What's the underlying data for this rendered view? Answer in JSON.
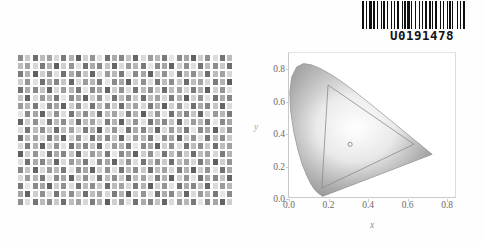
{
  "document": {
    "kind": "scanned-color-test-page",
    "background_color": "#fefefe"
  },
  "barcode": {
    "name": "archive-barcode",
    "value": "U0191478",
    "bar_color": "#101010",
    "pattern": [
      3,
      1,
      1,
      2,
      3,
      1,
      2,
      1,
      1,
      3,
      1,
      1,
      2,
      2,
      1,
      3,
      1,
      2,
      1,
      1,
      3,
      2,
      1,
      1,
      2,
      1,
      3,
      1,
      1,
      2,
      2,
      3,
      1,
      1,
      1,
      2,
      3,
      1,
      2,
      1,
      1,
      1,
      3,
      2,
      1,
      2,
      1,
      3,
      1,
      1,
      2,
      1,
      1,
      3,
      2,
      1,
      1,
      2,
      3,
      1
    ]
  },
  "swatch_chart": {
    "name": "color-swatch-test-chart",
    "columns": 30,
    "rows": 19,
    "cell_w": 7.2,
    "cell_h": 8.0,
    "swatch_w": 5.0,
    "swatch_h": 5.6,
    "note": "grayscale/desaturated scanned patch array",
    "grays": [
      "#8d8d8d",
      "#c9c9c9",
      "#6e6e6e",
      "#bdbdbd",
      "#a2a2a2",
      "#d6d6d6",
      "#7b7b7b",
      "#b2b2b2",
      "#5f5f5f",
      "#cfcfcf",
      "#949494",
      "#e0e0e0",
      "#717171",
      "#aaaaaa",
      "#868686",
      "#c4c4c4",
      "#666666",
      "#d9d9d9",
      "#9b9b9b",
      "#b7b7b7",
      "#7a7a7a",
      "#e4e4e4",
      "#8a8a8a",
      "#a6a6a6",
      "#626262",
      "#cdcdcd",
      "#909090",
      "#dcdcdc",
      "#757575",
      "#bbbbbb"
    ],
    "row_shift": [
      0,
      3,
      6,
      9,
      12,
      15,
      18,
      21,
      24,
      27,
      2,
      5,
      8,
      11,
      14,
      17,
      20,
      23,
      26
    ]
  },
  "chromaticity": {
    "name": "cie-1931-chromaticity-diagram",
    "type": "scatter",
    "xlabel": "x",
    "ylabel": "y",
    "xlim": [
      0.0,
      0.85
    ],
    "ylim": [
      0.0,
      0.9
    ],
    "xticks": [
      "0.0",
      "0.2",
      "0.4",
      "0.6",
      "0.8"
    ],
    "xtick_values": [
      0.0,
      0.2,
      0.4,
      0.6,
      0.8
    ],
    "yticks": [
      "0.0",
      "0.2",
      "0.4",
      "0.6",
      "0.8"
    ],
    "ytick_values": [
      0.0,
      0.2,
      0.4,
      0.6,
      0.8
    ],
    "grid": false,
    "locus_color": "#9a9a9a",
    "gamut_color": "#8a8a8a",
    "whitepoint": {
      "x": 0.313,
      "y": 0.329,
      "label": ""
    },
    "gamut_triangle": [
      {
        "x": 0.64,
        "y": 0.33
      },
      {
        "x": 0.2,
        "y": 0.7
      },
      {
        "x": 0.168,
        "y": 0.055
      }
    ],
    "spectral_locus": [
      {
        "x": 0.1741,
        "y": 0.005
      },
      {
        "x": 0.174,
        "y": 0.005
      },
      {
        "x": 0.1738,
        "y": 0.0049
      },
      {
        "x": 0.1736,
        "y": 0.0049
      },
      {
        "x": 0.1733,
        "y": 0.0048
      },
      {
        "x": 0.173,
        "y": 0.0048
      },
      {
        "x": 0.1726,
        "y": 0.0048
      },
      {
        "x": 0.1721,
        "y": 0.0048
      },
      {
        "x": 0.1714,
        "y": 0.0051
      },
      {
        "x": 0.1703,
        "y": 0.0058
      },
      {
        "x": 0.1689,
        "y": 0.0069
      },
      {
        "x": 0.1669,
        "y": 0.0086
      },
      {
        "x": 0.1644,
        "y": 0.0109
      },
      {
        "x": 0.1611,
        "y": 0.0138
      },
      {
        "x": 0.1566,
        "y": 0.0177
      },
      {
        "x": 0.151,
        "y": 0.0227
      },
      {
        "x": 0.144,
        "y": 0.0297
      },
      {
        "x": 0.1355,
        "y": 0.0399
      },
      {
        "x": 0.1241,
        "y": 0.0578
      },
      {
        "x": 0.1096,
        "y": 0.0868
      },
      {
        "x": 0.0913,
        "y": 0.1327
      },
      {
        "x": 0.0687,
        "y": 0.2007
      },
      {
        "x": 0.0454,
        "y": 0.295
      },
      {
        "x": 0.0235,
        "y": 0.4127
      },
      {
        "x": 0.0082,
        "y": 0.5384
      },
      {
        "x": 0.0039,
        "y": 0.6548
      },
      {
        "x": 0.0139,
        "y": 0.7502
      },
      {
        "x": 0.0389,
        "y": 0.812
      },
      {
        "x": 0.0743,
        "y": 0.8338
      },
      {
        "x": 0.1142,
        "y": 0.8262
      },
      {
        "x": 0.1547,
        "y": 0.8059
      },
      {
        "x": 0.1929,
        "y": 0.7816
      },
      {
        "x": 0.2296,
        "y": 0.7543
      },
      {
        "x": 0.2658,
        "y": 0.7243
      },
      {
        "x": 0.3016,
        "y": 0.6923
      },
      {
        "x": 0.3373,
        "y": 0.6589
      },
      {
        "x": 0.3731,
        "y": 0.6245
      },
      {
        "x": 0.4087,
        "y": 0.5896
      },
      {
        "x": 0.4441,
        "y": 0.5547
      },
      {
        "x": 0.4788,
        "y": 0.5202
      },
      {
        "x": 0.5125,
        "y": 0.4866
      },
      {
        "x": 0.5448,
        "y": 0.4544
      },
      {
        "x": 0.5752,
        "y": 0.4242
      },
      {
        "x": 0.6029,
        "y": 0.3965
      },
      {
        "x": 0.627,
        "y": 0.3725
      },
      {
        "x": 0.6482,
        "y": 0.3514
      },
      {
        "x": 0.6658,
        "y": 0.334
      },
      {
        "x": 0.6801,
        "y": 0.3197
      },
      {
        "x": 0.6915,
        "y": 0.3083
      },
      {
        "x": 0.7006,
        "y": 0.2993
      },
      {
        "x": 0.7079,
        "y": 0.292
      },
      {
        "x": 0.714,
        "y": 0.2859
      },
      {
        "x": 0.719,
        "y": 0.2809
      },
      {
        "x": 0.723,
        "y": 0.277
      },
      {
        "x": 0.726,
        "y": 0.274
      },
      {
        "x": 0.7283,
        "y": 0.2717
      },
      {
        "x": 0.73,
        "y": 0.27
      },
      {
        "x": 0.7311,
        "y": 0.2689
      },
      {
        "x": 0.732,
        "y": 0.268
      },
      {
        "x": 0.7327,
        "y": 0.2673
      },
      {
        "x": 0.7334,
        "y": 0.2666
      }
    ]
  }
}
